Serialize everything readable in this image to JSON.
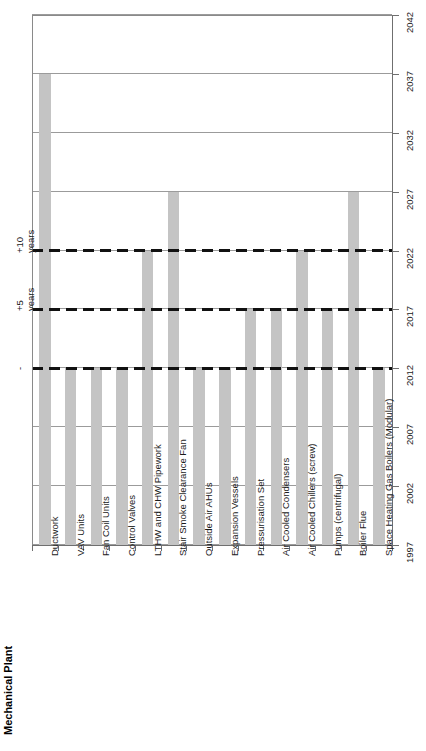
{
  "title": "Mechanical Plant",
  "annotations": [
    {
      "name": "plus-ten-years",
      "line1": "+10",
      "line2": "years",
      "at_year": 2022
    },
    {
      "name": "plus-five-years",
      "line1": "+5",
      "line2": "years",
      "at_year": 2017
    },
    {
      "name": "now",
      "line1": "-",
      "line2": "",
      "at_year": 2012
    }
  ],
  "chart_data": {
    "type": "bar",
    "orientation": "vertical-rotated",
    "title": "Mechanical Plant",
    "xlabel": "",
    "ylabel": "",
    "ylim": [
      1997,
      2042
    ],
    "grid": true,
    "baseline": 1997,
    "tick_labels": [
      "1997",
      "2002",
      "2007",
      "2012",
      "2017",
      "2022",
      "2027",
      "2032",
      "2037",
      "2042"
    ],
    "ticks": [
      1997,
      2002,
      2007,
      2012,
      2017,
      2022,
      2027,
      2032,
      2037,
      2042
    ],
    "bar_color": "#c4c4c4",
    "reference_lines": [
      {
        "label": "-",
        "value": 2012,
        "style": "dashed",
        "color": "#111111"
      },
      {
        "label": "+5 years",
        "value": 2017,
        "style": "dashed",
        "color": "#111111"
      },
      {
        "label": "+10 years",
        "value": 2022,
        "style": "dashed",
        "color": "#111111"
      }
    ],
    "categories": [
      "Ductwork",
      "VAV Units",
      "Fan Coil Units",
      "Control Valves",
      "LTHW and CHW Pipework",
      "Stair Smoke Clearance Fan",
      "Outside Air AHUs",
      "Expansion Vessels",
      "Pressurisation Set",
      "Air Cooled Condensers",
      "Air Cooled Chillers (screw)",
      "Pumps (centrifugal)",
      "Boiler Flue",
      "Space Heating Gas Boilers (Modular)"
    ],
    "values": [
      2037,
      2012,
      2012,
      2012,
      2022,
      2027,
      2012,
      2012,
      2017,
      2017,
      2022,
      2017,
      2027,
      2012
    ]
  }
}
